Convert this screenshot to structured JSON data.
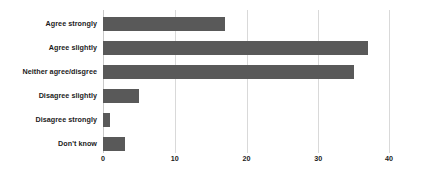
{
  "chart_data": {
    "type": "bar",
    "orientation": "horizontal",
    "title": "",
    "xlabel": "",
    "ylabel": "",
    "categories": [
      "Agree strongly",
      "Agree slightly",
      "Neither agree/disgree",
      "Disagree slightly",
      "Disagree strongly",
      "Don't know"
    ],
    "values": [
      17,
      37,
      35,
      5,
      1,
      3
    ],
    "xlim": [
      0,
      40
    ],
    "xticks": [
      0,
      10,
      20,
      30,
      40
    ],
    "xtick_labels": [
      "0",
      "10",
      "20",
      "30",
      "40"
    ],
    "grid": "vertical",
    "legend": "none",
    "bar_color": "#595959",
    "gridline_color": "#d9d9d9",
    "text_color": "#1b1b1b",
    "background": "#ffffff"
  }
}
